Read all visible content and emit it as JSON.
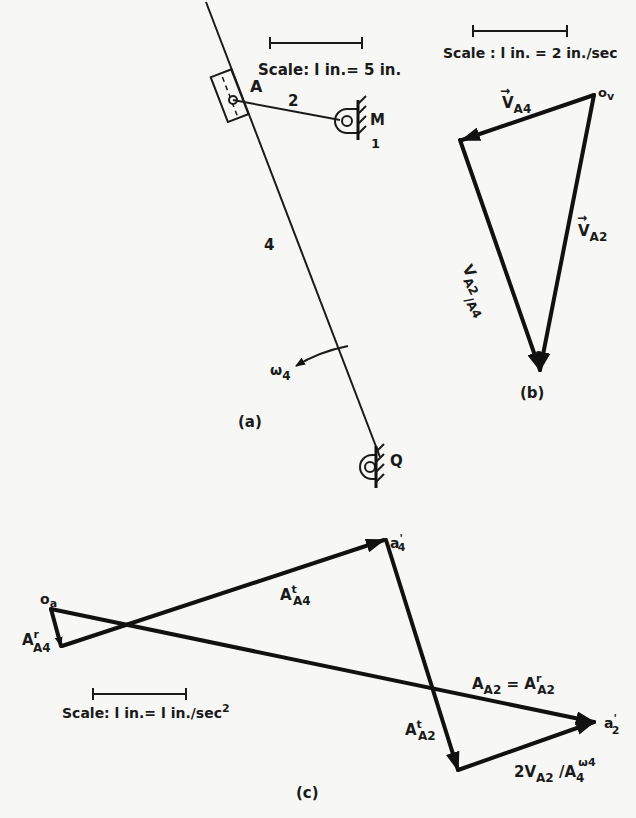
{
  "figure_a": {
    "caption": "(a)",
    "scale_label": "Scale: l in.= 5 in.",
    "labels": {
      "slider": "A",
      "link2": "2",
      "pivot_m": "M",
      "ground": "1",
      "link4": "4",
      "omega": "ω",
      "omega_sub": "4",
      "pivot_q": "Q"
    }
  },
  "figure_b": {
    "caption": "(b)",
    "scale_label": "Scale : l in. = 2 in./sec",
    "pole": "o",
    "pole_sub": "v",
    "vectors": {
      "va4": {
        "main": "V",
        "sub": "A4"
      },
      "va2": {
        "main": "V",
        "sub": "A2"
      },
      "va2a4": {
        "main": "V",
        "sub": "A2",
        "sub2": "/A4"
      }
    }
  },
  "figure_c": {
    "caption": "(c)",
    "scale_label": "Scale:  l in.= l in./sec",
    "scale_exp": "2",
    "pole": "o",
    "pole_sub": "a",
    "points": {
      "a4p": {
        "main": "a",
        "sub": "4",
        "sup": "'"
      },
      "a2p": {
        "main": "a",
        "sub": "2",
        "sup": "'"
      }
    },
    "vectors": {
      "aa4r": {
        "main": "A",
        "sup": "r",
        "sub": "A4"
      },
      "aa4t": {
        "main": "A",
        "sup": "t",
        "sub": "A4"
      },
      "aa2t": {
        "main": "A",
        "sup": "t",
        "sub": "A2"
      },
      "aa2_eq": {
        "main": "A",
        "sub": "A2",
        "eq": " = A",
        "eq_sup": "r",
        "eq_sub": "A2"
      },
      "coriolis": {
        "main": "2V",
        "sub": "A2",
        "mid": " /A",
        "sub2": "4",
        "sup": "ω4"
      }
    }
  }
}
